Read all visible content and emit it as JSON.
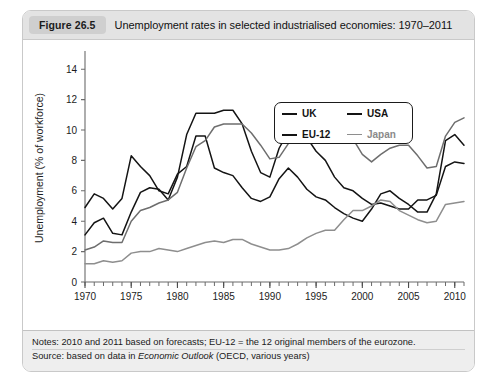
{
  "figure": {
    "badge": "Figure 26.5",
    "title": "Unemployment rates in selected industrialised economies: 1970–2011"
  },
  "notes": {
    "line1_prefix": "Notes: 2010 and 2011 based on forecasts; EU-12 = the 12 original members of the eurozone.",
    "line2_prefix": "Source: based on data in ",
    "line2_italic": "Economic Outlook",
    "line2_suffix": " (OECD, various years)"
  },
  "legend": {
    "items": [
      {
        "label": "UK",
        "color": "#141414",
        "width": 2.1
      },
      {
        "label": "USA",
        "color": "#141414",
        "width": 2.1
      },
      {
        "label": "EU-12",
        "color": "#141414",
        "width": 2.1
      },
      {
        "label": "Japan",
        "color": "#8e8e8e",
        "width": 1.6
      }
    ]
  },
  "chart_data": {
    "type": "line",
    "title": "Unemployment rates in selected industrialised economies: 1970–2011",
    "xlabel": "",
    "ylabel": "Unemployment (% of workforce)",
    "xlim": [
      1970,
      2011
    ],
    "ylim": [
      0,
      15
    ],
    "yticks": [
      0,
      2,
      4,
      6,
      8,
      10,
      12,
      14
    ],
    "xticks": [
      1970,
      1975,
      1980,
      1985,
      1990,
      1995,
      2000,
      2005,
      2010
    ],
    "xtick_minor_step": 1,
    "grid": false,
    "legend_position": "top-right",
    "x": [
      1970,
      1971,
      1972,
      1973,
      1974,
      1975,
      1976,
      1977,
      1978,
      1979,
      1980,
      1981,
      1982,
      1983,
      1984,
      1985,
      1986,
      1987,
      1988,
      1989,
      1990,
      1991,
      1992,
      1993,
      1994,
      1995,
      1996,
      1997,
      1998,
      1999,
      2000,
      2001,
      2002,
      2003,
      2004,
      2005,
      2006,
      2007,
      2008,
      2009,
      2010,
      2011
    ],
    "series": [
      {
        "name": "UK",
        "color": "#141414",
        "width": 1.5,
        "values": [
          3.1,
          3.9,
          4.2,
          3.2,
          3.1,
          4.6,
          5.9,
          6.2,
          6.1,
          5.4,
          6.9,
          9.7,
          11.1,
          11.1,
          11.1,
          11.3,
          11.3,
          10.4,
          8.6,
          7.2,
          6.9,
          8.8,
          9.9,
          10.4,
          9.5,
          8.6,
          8.0,
          6.9,
          6.2,
          6.0,
          5.5,
          5.1,
          5.2,
          5.0,
          4.8,
          4.8,
          5.4,
          5.4,
          5.7,
          7.6,
          7.9,
          7.8
        ]
      },
      {
        "name": "USA",
        "color": "#141414",
        "width": 1.5,
        "values": [
          4.9,
          5.8,
          5.5,
          4.8,
          5.5,
          8.3,
          7.6,
          7.0,
          6.0,
          5.8,
          7.1,
          7.6,
          9.6,
          9.6,
          7.5,
          7.2,
          7.0,
          6.2,
          5.5,
          5.3,
          5.6,
          6.8,
          7.5,
          6.9,
          6.1,
          5.6,
          5.4,
          4.9,
          4.5,
          4.2,
          4.0,
          4.8,
          5.8,
          6.0,
          5.5,
          5.1,
          4.6,
          4.6,
          5.8,
          9.3,
          9.7,
          9.0
        ]
      },
      {
        "name": "EU-12",
        "color": "#6e6e6e",
        "width": 1.5,
        "values": [
          2.1,
          2.3,
          2.7,
          2.6,
          2.6,
          4.0,
          4.7,
          4.9,
          5.2,
          5.4,
          5.9,
          7.5,
          8.9,
          9.3,
          10.2,
          10.4,
          10.4,
          10.4,
          9.8,
          9.0,
          8.1,
          8.2,
          9.1,
          10.7,
          11.1,
          10.8,
          10.9,
          10.9,
          10.2,
          9.4,
          8.4,
          7.9,
          8.4,
          8.8,
          9.0,
          9.0,
          8.3,
          7.5,
          7.6,
          9.6,
          10.5,
          10.8
        ]
      },
      {
        "name": "Japan",
        "color": "#8e8e8e",
        "width": 1.5,
        "values": [
          1.2,
          1.2,
          1.4,
          1.3,
          1.4,
          1.9,
          2.0,
          2.0,
          2.2,
          2.1,
          2.0,
          2.2,
          2.4,
          2.6,
          2.7,
          2.6,
          2.8,
          2.8,
          2.5,
          2.3,
          2.1,
          2.1,
          2.2,
          2.5,
          2.9,
          3.2,
          3.4,
          3.4,
          4.1,
          4.7,
          4.7,
          5.0,
          5.4,
          5.3,
          4.7,
          4.4,
          4.1,
          3.9,
          4.0,
          5.1,
          5.2,
          5.3
        ]
      }
    ]
  },
  "axis": {
    "ylabel": "Unemployment (% of workforce)",
    "ytick_labels": [
      "0",
      "2",
      "4",
      "6",
      "8",
      "10",
      "12",
      "14"
    ],
    "xtick_labels": [
      "1970",
      "1975",
      "1980",
      "1985",
      "1990",
      "1995",
      "2000",
      "2005",
      "2010"
    ]
  }
}
